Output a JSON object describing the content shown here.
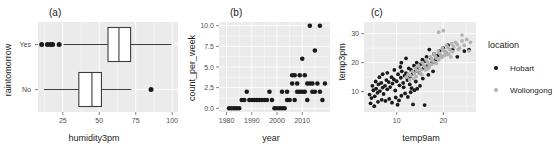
{
  "figure": {
    "width": 558,
    "height": 146,
    "background": "#ffffff",
    "panel_background": "#ebebeb",
    "grid_color": "#ffffff"
  },
  "panels": {
    "a": {
      "tag": "(a)"
    },
    "b": {
      "tag": "(b)"
    },
    "c": {
      "tag": "(c)"
    }
  },
  "legend": {
    "title": "location",
    "items": [
      {
        "label": "Hobart",
        "color": "#1a1a1a",
        "marker": "filled-circle"
      },
      {
        "label": "Wollongong",
        "color": "#b3b3b3",
        "marker": "filled-circle"
      }
    ]
  },
  "chart_data": [
    {
      "panel": "a",
      "type": "boxplot",
      "title": "(a)",
      "xlabel": "humidity3pm",
      "ylabel": "raintomorrow",
      "orientation": "horizontal",
      "xlim": [
        8,
        104
      ],
      "xticks": [
        25,
        50,
        75,
        100
      ],
      "xtick_labels": [
        "25",
        "50",
        "75",
        "100"
      ],
      "categories": [
        "Yes",
        "No"
      ],
      "grid": true,
      "boxes": [
        {
          "category": "Yes",
          "whisker_low": 25.5,
          "q1": 56.0,
          "median": 63.5,
          "q3": 71.5,
          "whisker_high": 99.5,
          "outliers": [
            10.5,
            14.5,
            16.5,
            18.0,
            22.5
          ]
        },
        {
          "category": "No",
          "whisker_low": 12.0,
          "q1": 36.0,
          "median": 45.0,
          "q3": 51.5,
          "whisker_high": 72.0,
          "outliers": [
            85.5
          ]
        }
      ]
    },
    {
      "panel": "b",
      "type": "scatter",
      "title": "(b)",
      "xlabel": "year",
      "ylabel": "count_per_week",
      "xlim": [
        1977,
        2021
      ],
      "ylim": [
        -0.45,
        10.45
      ],
      "xticks": [
        1980,
        1990,
        2000,
        2010
      ],
      "xtick_labels": [
        "1980",
        "1990",
        "2000",
        "2010"
      ],
      "yticks": [
        0.0,
        2.5,
        5.0,
        7.5,
        10.0
      ],
      "ytick_labels": [
        "0.0",
        "2.5",
        "5.0",
        "7.5",
        "10.0"
      ],
      "grid": true,
      "marker_color": "#1a1a1a",
      "points": [
        [
          1981,
          0
        ],
        [
          1982,
          0
        ],
        [
          1983,
          0
        ],
        [
          1984,
          0
        ],
        [
          1985,
          0
        ],
        [
          1986,
          1
        ],
        [
          1987,
          1
        ],
        [
          1988,
          2
        ],
        [
          1989,
          1
        ],
        [
          1990,
          1
        ],
        [
          1991,
          1
        ],
        [
          1992,
          1
        ],
        [
          1993,
          1
        ],
        [
          1994,
          1
        ],
        [
          1995,
          1
        ],
        [
          1996,
          1
        ],
        [
          1997,
          2
        ],
        [
          1998,
          1
        ],
        [
          1999,
          0
        ],
        [
          2000,
          0
        ],
        [
          2001,
          0
        ],
        [
          2002,
          0
        ],
        [
          2003,
          0
        ],
        [
          2004,
          1
        ],
        [
          2005,
          1
        ],
        [
          2006,
          3
        ],
        [
          2007,
          1
        ],
        [
          2008,
          3
        ],
        [
          2009,
          2
        ],
        [
          2010,
          2
        ],
        [
          2011,
          4
        ],
        [
          2012,
          1
        ],
        [
          2013,
          3
        ],
        [
          2014,
          2
        ],
        [
          2015,
          7
        ],
        [
          2016,
          3
        ],
        [
          2017,
          2
        ],
        [
          2018,
          1
        ],
        [
          2019,
          3
        ],
        [
          2006,
          4
        ],
        [
          2010,
          6
        ],
        [
          2013,
          10
        ],
        [
          2017,
          10
        ],
        [
          2008,
          2
        ],
        [
          2012,
          3
        ],
        [
          2015,
          2
        ],
        [
          2002,
          2
        ],
        [
          2004,
          2
        ],
        [
          2011,
          2
        ],
        [
          2014,
          3
        ],
        [
          2009,
          4
        ],
        [
          2007,
          4
        ]
      ]
    },
    {
      "panel": "c",
      "type": "scatter",
      "title": "(c)",
      "xlabel": "temp9am",
      "ylabel": "temp3pm",
      "xlim": [
        3,
        27
      ],
      "ylim": [
        3,
        34
      ],
      "xticks": [
        10,
        20
      ],
      "xtick_labels": [
        "10",
        "20"
      ],
      "yticks": [
        10,
        20,
        30
      ],
      "ytick_labels": [
        "10",
        "20",
        "30"
      ],
      "grid": true,
      "legend_title": "location",
      "legend_position": "right",
      "series": [
        {
          "name": "Hobart",
          "color": "#1a1a1a",
          "points": [
            [
              4.2,
              9.0
            ],
            [
              4.6,
              7.8
            ],
            [
              5.0,
              10.5
            ],
            [
              5.3,
              8.4
            ],
            [
              5.6,
              11.0
            ],
            [
              5.9,
              9.6
            ],
            [
              6.1,
              12.5
            ],
            [
              6.4,
              10.2
            ],
            [
              6.7,
              13.0
            ],
            [
              7.0,
              11.4
            ],
            [
              7.2,
              9.2
            ],
            [
              7.5,
              12.0
            ],
            [
              7.8,
              14.0
            ],
            [
              8.0,
              10.8
            ],
            [
              8.3,
              13.3
            ],
            [
              8.6,
              11.6
            ],
            [
              8.9,
              15.0
            ],
            [
              9.1,
              12.8
            ],
            [
              9.4,
              14.2
            ],
            [
              9.7,
              10.4
            ],
            [
              10.0,
              13.6
            ],
            [
              10.3,
              16.0
            ],
            [
              10.6,
              12.2
            ],
            [
              10.9,
              14.8
            ],
            [
              11.1,
              17.0
            ],
            [
              11.4,
              13.0
            ],
            [
              11.7,
              15.5
            ],
            [
              12.0,
              16.4
            ],
            [
              12.3,
              14.0
            ],
            [
              12.6,
              18.0
            ],
            [
              12.9,
              15.2
            ],
            [
              13.1,
              17.5
            ],
            [
              13.4,
              16.2
            ],
            [
              13.7,
              19.0
            ],
            [
              14.0,
              17.0
            ],
            [
              14.3,
              20.0
            ],
            [
              14.6,
              18.2
            ],
            [
              14.9,
              16.5
            ],
            [
              15.2,
              19.5
            ],
            [
              15.5,
              21.0
            ],
            [
              15.8,
              18.0
            ],
            [
              16.1,
              20.5
            ],
            [
              16.4,
              22.0
            ],
            [
              16.7,
              19.0
            ],
            [
              17.0,
              24.5
            ],
            [
              17.3,
              21.5
            ],
            [
              17.6,
              20.0
            ],
            [
              18.0,
              23.0
            ],
            [
              18.4,
              21.0
            ],
            [
              18.8,
              22.5
            ],
            [
              19.2,
              24.0
            ],
            [
              19.6,
              22.0
            ],
            [
              20.0,
              25.0
            ],
            [
              20.5,
              23.5
            ],
            [
              21.0,
              26.0
            ],
            [
              22.0,
              24.5
            ],
            [
              23.0,
              22.0
            ],
            [
              24.5,
              24.0
            ],
            [
              25.5,
              24.5
            ],
            [
              6.0,
              6.5
            ],
            [
              6.8,
              7.2
            ],
            [
              7.6,
              6.8
            ],
            [
              8.4,
              7.5
            ],
            [
              9.0,
              6.2
            ],
            [
              9.8,
              8.0
            ],
            [
              10.5,
              7.0
            ],
            [
              11.0,
              8.6
            ],
            [
              11.8,
              9.4
            ],
            [
              12.4,
              8.2
            ],
            [
              13.0,
              9.8
            ],
            [
              13.8,
              10.5
            ],
            [
              14.4,
              11.0
            ],
            [
              15.0,
              12.0
            ],
            [
              10.2,
              5.5
            ],
            [
              13.5,
              5.6
            ],
            [
              16.0,
              5.4
            ],
            [
              8.0,
              16.5
            ],
            [
              12.0,
              21.5
            ],
            [
              11.0,
              20.0
            ],
            [
              5.5,
              13.5
            ],
            [
              4.8,
              12.0
            ],
            [
              4.4,
              6.0
            ],
            [
              5.2,
              5.0
            ],
            [
              6.3,
              15.0
            ],
            [
              7.0,
              16.0
            ],
            [
              9.5,
              17.5
            ],
            [
              10.8,
              18.5
            ],
            [
              12.8,
              12.5
            ],
            [
              14.1,
              13.5
            ],
            [
              15.6,
              14.5
            ],
            [
              16.8,
              15.8
            ],
            [
              17.8,
              17.0
            ],
            [
              13.2,
              11.2
            ],
            [
              11.5,
              11.5
            ]
          ]
        },
        {
          "name": "Wollongong",
          "color": "#b3b3b3",
          "points": [
            [
              12.0,
              15.0
            ],
            [
              12.5,
              16.0
            ],
            [
              13.0,
              15.5
            ],
            [
              13.4,
              17.0
            ],
            [
              13.8,
              16.2
            ],
            [
              14.0,
              18.0
            ],
            [
              14.3,
              17.2
            ],
            [
              14.6,
              19.0
            ],
            [
              14.9,
              18.4
            ],
            [
              15.2,
              17.6
            ],
            [
              15.5,
              20.0
            ],
            [
              15.8,
              19.2
            ],
            [
              16.0,
              18.6
            ],
            [
              16.3,
              21.0
            ],
            [
              16.6,
              20.2
            ],
            [
              16.9,
              19.5
            ],
            [
              17.2,
              22.0
            ],
            [
              17.5,
              21.2
            ],
            [
              17.8,
              20.5
            ],
            [
              18.0,
              23.0
            ],
            [
              18.3,
              22.2
            ],
            [
              18.6,
              21.5
            ],
            [
              18.9,
              24.0
            ],
            [
              19.2,
              23.2
            ],
            [
              19.5,
              22.5
            ],
            [
              19.8,
              25.0
            ],
            [
              20.1,
              24.2
            ],
            [
              20.4,
              23.5
            ],
            [
              20.7,
              26.0
            ],
            [
              21.0,
              25.2
            ],
            [
              21.4,
              24.5
            ],
            [
              21.8,
              26.5
            ],
            [
              22.2,
              25.5
            ],
            [
              22.6,
              27.0
            ],
            [
              23.0,
              26.2
            ],
            [
              23.5,
              25.0
            ],
            [
              24.0,
              27.5
            ],
            [
              24.5,
              26.0
            ],
            [
              25.0,
              28.0
            ],
            [
              25.8,
              27.0
            ],
            [
              19.0,
              30.5
            ],
            [
              20.0,
              31.0
            ],
            [
              24.0,
              29.5
            ],
            [
              25.5,
              24.0
            ],
            [
              15.0,
              16.5
            ],
            [
              15.4,
              15.8
            ],
            [
              16.1,
              17.5
            ],
            [
              16.8,
              18.0
            ],
            [
              17.4,
              19.4
            ],
            [
              18.2,
              20.0
            ],
            [
              19.0,
              21.0
            ],
            [
              19.6,
              21.8
            ],
            [
              20.2,
              22.4
            ],
            [
              21.2,
              23.0
            ],
            [
              13.6,
              14.5
            ],
            [
              14.2,
              15.2
            ],
            [
              12.8,
              14.0
            ],
            [
              22.0,
              23.8
            ],
            [
              23.2,
              24.6
            ],
            [
              17.0,
              18.8
            ],
            [
              18.5,
              19.8
            ],
            [
              16.5,
              17.8
            ],
            [
              20.8,
              22.8
            ],
            [
              21.6,
              22.0
            ]
          ]
        }
      ]
    }
  ]
}
